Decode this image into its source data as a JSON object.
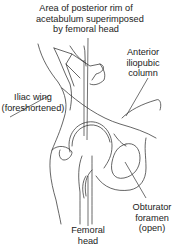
{
  "diagram": {
    "type": "anatomical-line-drawing",
    "labels": {
      "posterior_rim": {
        "lines": [
          "Area of posterior rim of",
          "acetabulum superimposed",
          "by femoral head"
        ]
      },
      "anterior_column": {
        "lines": [
          "Anterior",
          "iliopubic",
          "column"
        ]
      },
      "iliac_wing": {
        "lines": [
          "Iliac wing",
          "(foreshortened)"
        ]
      },
      "obturator_foramen": {
        "lines": [
          "Obturator",
          "foramen",
          "(open)"
        ]
      },
      "femoral_head": {
        "lines": [
          "Femoral",
          "head"
        ]
      }
    },
    "colors": {
      "line": "#333333",
      "text": "#222222",
      "background": "#ffffff"
    }
  }
}
